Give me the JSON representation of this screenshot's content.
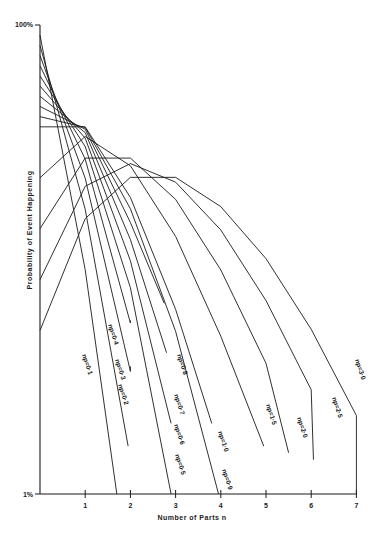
{
  "chart_data": {
    "type": "line",
    "title": "",
    "xlabel": "Number of Parts  n",
    "ylabel": "Probability of Event Happening",
    "yscale": "log",
    "ylim": [
      1,
      100
    ],
    "xlim": [
      0,
      7
    ],
    "y_tick_labels": [
      "100%",
      "1%"
    ],
    "x_tick_labels": [
      "1",
      "2",
      "3",
      "4",
      "5",
      "6",
      "7"
    ],
    "grid": false,
    "legend": "inline labels along curves",
    "series": [
      {
        "name": "np=0·1",
        "np": 0.1,
        "label": "np=0·1",
        "label_pos": [
          82,
          355
        ],
        "end": [
          1.7,
          1.0
        ]
      },
      {
        "name": "np=0·2",
        "np": 0.2,
        "label": "np=0·2",
        "label_pos": [
          118,
          385
        ],
        "end": [
          1.95,
          1.6
        ]
      },
      {
        "name": "np=0·3",
        "np": 0.3,
        "label": "np=0·3",
        "label_pos": [
          115,
          360
        ],
        "end": [
          2.0,
          3.5
        ]
      },
      {
        "name": "np=0·4",
        "np": 0.4,
        "label": "np=0·4",
        "label_pos": [
          108,
          325
        ],
        "end": [
          2.0,
          5.5
        ]
      },
      {
        "name": "np=0·5",
        "np": 0.5,
        "label": "np=0·5",
        "label_pos": [
          175,
          455
        ],
        "end": [
          2.9,
          1.0
        ]
      },
      {
        "name": "np=0·6",
        "np": 0.6,
        "label": "np=0·6",
        "label_pos": [
          174,
          425
        ],
        "end": [
          2.9,
          2.0
        ]
      },
      {
        "name": "np=0·7",
        "np": 0.7,
        "label": "np=0·7",
        "label_pos": [
          174,
          395
        ],
        "end": [
          2.8,
          4.0
        ]
      },
      {
        "name": "np=0·8",
        "np": 0.8,
        "label": "np=0·8",
        "label_pos": [
          177,
          355
        ],
        "end": [
          2.75,
          6.5
        ]
      },
      {
        "name": "np=0·9",
        "np": 0.9,
        "label": "np=0·9",
        "label_pos": [
          222,
          470
        ],
        "end": [
          3.95,
          1.0
        ]
      },
      {
        "name": "np=1·0",
        "np": 1.0,
        "label": "np=1·0",
        "label_pos": [
          218,
          432
        ],
        "end": [
          3.8,
          2.0
        ]
      },
      {
        "name": "np=1·5",
        "np": 1.5,
        "label": "np=1·5",
        "label_pos": [
          266,
          405
        ],
        "end": [
          4.95,
          1.6
        ]
      },
      {
        "name": "np=2·0",
        "np": 2.0,
        "label": "np=2·0",
        "label_pos": [
          297,
          418
        ],
        "end": [
          5.5,
          1.5
        ]
      },
      {
        "name": "np=2·5",
        "np": 2.5,
        "label": "np=2·5",
        "label_pos": [
          332,
          398
        ],
        "end": [
          6.05,
          1.4
        ]
      },
      {
        "name": "np=3·0",
        "np": 3.0,
        "label": "np=3·0",
        "label_pos": [
          355,
          360
        ],
        "end": [
          7.0,
          1.0
        ]
      }
    ]
  }
}
